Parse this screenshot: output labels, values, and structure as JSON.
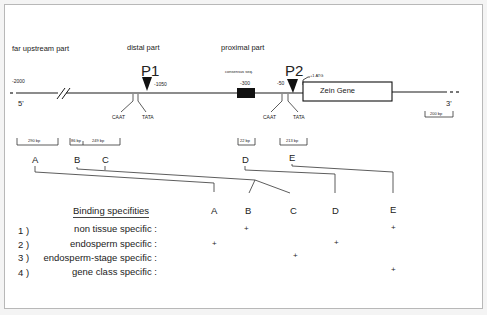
{
  "regions": {
    "far_upstream": "far upstream part",
    "distal": "distal part",
    "proximal": "proximal part"
  },
  "promoters": {
    "p1": {
      "label": "P1",
      "position": "-1050"
    },
    "p2": {
      "label": "P2",
      "position": "-50",
      "atg": "+1 ATG"
    }
  },
  "positions": {
    "start": "-2000",
    "consensus_pos": "-300",
    "consensus_label": "consensus seq."
  },
  "ends": {
    "five_prime": "5'",
    "three_prime": "3'"
  },
  "elements": {
    "caat": "CAAT",
    "tata": "TATA",
    "gene": "Zein Gene"
  },
  "scale_bars": [
    {
      "id": "A",
      "label": "290 bp"
    },
    {
      "id": "B",
      "label": "86 bp"
    },
    {
      "id": "C",
      "label": "249 bp"
    },
    {
      "id": "D",
      "label": "22 bp"
    },
    {
      "id": "E",
      "label": "213 bp"
    },
    {
      "id": "ref",
      "label": "200 bp"
    }
  ],
  "fragments": [
    "A",
    "B",
    "C",
    "D",
    "E"
  ],
  "table": {
    "title": "Binding specifities",
    "columns": [
      "A",
      "B",
      "C",
      "D",
      "E"
    ],
    "rows": [
      {
        "num": "1 )",
        "label": "non tissue specific :",
        "marks": [
          "",
          "+",
          "",
          "",
          "+"
        ]
      },
      {
        "num": "2 )",
        "label": "endosperm specific :",
        "marks": [
          "+",
          "",
          "",
          "+",
          ""
        ]
      },
      {
        "num": "3 )",
        "label": "endosperm-stage specific :",
        "marks": [
          "",
          "",
          "+",
          "",
          ""
        ]
      },
      {
        "num": "4 )",
        "label": "gene class specific :",
        "marks": [
          "",
          "",
          "",
          "",
          "+"
        ]
      }
    ]
  },
  "colors": {
    "line": "#1a1a1a",
    "border": "#b8b8b8",
    "background": "#ffffff"
  }
}
